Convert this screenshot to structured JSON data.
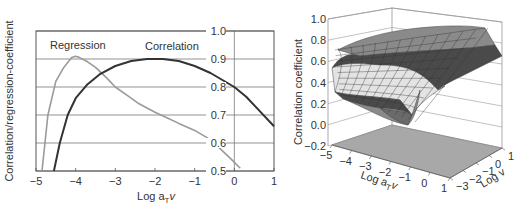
{
  "chart_data": [
    {
      "type": "line",
      "title": "",
      "xlabel": "Log a_T v",
      "xlabel_main": "Log a",
      "xlabel_sub": "T",
      "xlabel_tail": "v",
      "ylabel": "Correlation/regression-coefficient",
      "xlim": [
        -5,
        1
      ],
      "ylim": [
        0.5,
        1.0
      ],
      "grid": true,
      "x_ticks": [
        "-5",
        "-4",
        "-3",
        "-2",
        "-1",
        "0",
        "1"
      ],
      "y_ticks": [
        "1.0",
        "0.9",
        "0.8",
        "0.7",
        "0.6",
        "0.5"
      ],
      "annotations": [
        "Regression",
        "Correlation"
      ],
      "series": [
        {
          "name": "Regression",
          "color": "#9a9a9a",
          "x": [
            -4.85,
            -4.7,
            -4.5,
            -4.3,
            -4.1,
            -4.0,
            -3.9,
            -3.7,
            -3.5,
            -3.2,
            -3.0,
            -2.7,
            -2.4,
            -2.0,
            -1.7,
            -1.4,
            -1.0,
            -0.7,
            -0.4,
            -0.1,
            0.15
          ],
          "y": [
            0.5,
            0.7,
            0.82,
            0.87,
            0.905,
            0.91,
            0.905,
            0.89,
            0.87,
            0.83,
            0.8,
            0.77,
            0.74,
            0.71,
            0.69,
            0.67,
            0.645,
            0.62,
            0.585,
            0.545,
            0.51
          ]
        },
        {
          "name": "Correlation",
          "color": "#333333",
          "x": [
            -4.55,
            -4.4,
            -4.2,
            -4.0,
            -3.7,
            -3.4,
            -3.0,
            -2.6,
            -2.2,
            -1.8,
            -1.4,
            -1.0,
            -0.6,
            -0.3,
            0.0,
            0.3,
            0.6,
            1.0
          ],
          "y": [
            0.5,
            0.6,
            0.7,
            0.76,
            0.81,
            0.845,
            0.875,
            0.893,
            0.9,
            0.9,
            0.893,
            0.875,
            0.85,
            0.825,
            0.8,
            0.765,
            0.72,
            0.66
          ]
        }
      ]
    },
    {
      "type": "surface",
      "title": "",
      "xlabel": "Log a_T v",
      "xlabel_main": "Log a",
      "xlabel_sub": "T",
      "xlabel_tail": "v",
      "ylabel": "Log v",
      "zlabel": "Correlation coefficient",
      "xlim": [
        -5,
        1
      ],
      "ylim": [
        -3,
        1
      ],
      "zlim": [
        -0.2,
        1.0
      ],
      "x_ticks": [
        "-5",
        "-4",
        "-3",
        "-2",
        "-1",
        "0",
        "1"
      ],
      "y_ticks": [
        "-3",
        "-2",
        "-1",
        "0",
        "1"
      ],
      "z_ticks": [
        "1.0",
        "0.8",
        "0.6",
        "0.4",
        "0.2",
        "0.0",
        "-0.2"
      ],
      "band_colors": [
        "#e3e3e3",
        "#4a4a4a",
        "#8a8a8a",
        "#b5b5b5"
      ],
      "floor_color": "#a8a8a8"
    }
  ]
}
